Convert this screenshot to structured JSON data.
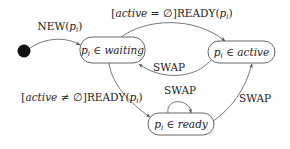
{
  "diagram": {
    "type": "state-machine",
    "initial": {
      "label": "initial-state"
    },
    "states": [
      {
        "id": "waiting",
        "var": "p",
        "sub": "i",
        "op": "∈",
        "set": "waiting"
      },
      {
        "id": "active",
        "var": "p",
        "sub": "i",
        "op": "∈",
        "set": "active"
      },
      {
        "id": "ready",
        "var": "p",
        "sub": "i",
        "op": "∈",
        "set": "ready"
      }
    ],
    "transitions": [
      {
        "from": "initial",
        "to": "waiting",
        "event": "NEW",
        "arg": "p",
        "arg_sub": "i",
        "guard": ""
      },
      {
        "from": "waiting",
        "to": "active",
        "event": "READY",
        "arg": "p",
        "arg_sub": "i",
        "guard_var": "active",
        "guard_op": "=",
        "guard_val": "∅"
      },
      {
        "from": "active",
        "to": "waiting",
        "event": "SWAP"
      },
      {
        "from": "waiting",
        "to": "ready",
        "event": "READY",
        "arg": "p",
        "arg_sub": "i",
        "guard_var": "active",
        "guard_op": "≠",
        "guard_val": "∅"
      },
      {
        "from": "ready",
        "to": "ready",
        "event": "SWAP"
      },
      {
        "from": "ready",
        "to": "active",
        "event": "SWAP"
      }
    ]
  },
  "text": {
    "new_event": "NEW(",
    "close_paren": ")",
    "p": "p",
    "i": "i",
    "ready_event": "]READY(",
    "open_bracket": "[",
    "active": "active",
    "eq_empty": " = ∅",
    "neq_empty": " ≠ ∅",
    "swap": "SWAP",
    "in": " ∈ ",
    "waiting": "waiting",
    "ready": "ready"
  }
}
